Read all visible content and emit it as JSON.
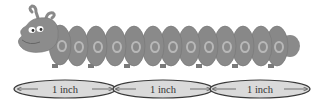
{
  "figure": {
    "segment_count": 13,
    "colors": {
      "body": "#8a8a8a",
      "body_dark": "#6f6f6f",
      "spot": "#b4b4b4",
      "ellipse_fill": "#d9d9d9",
      "ellipse_stroke": "#3a3a3a"
    }
  },
  "rulers": [
    {
      "label": "1 inch"
    },
    {
      "label": "1 inch"
    },
    {
      "label": "1 inch"
    }
  ]
}
